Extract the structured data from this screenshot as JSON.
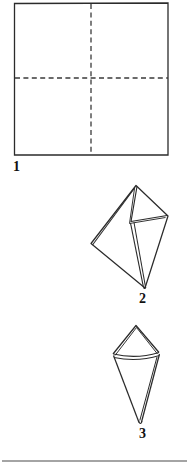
{
  "document": {
    "kind": "origami-instruction-diagram",
    "background_color": "#ffffff",
    "ink_color": "#1a1a1a",
    "steps_count": 3
  },
  "steps": [
    {
      "number": "1",
      "label": "1",
      "caption": "",
      "shape_name": "square-sheet-with-crease-lines",
      "description_hint": "square-outline-with-horizontal-and-vertical-dashed-creases"
    },
    {
      "number": "2",
      "label": "2",
      "caption": "",
      "shape_name": "folded-diamond-kite",
      "description_hint": "diamond-shaped-folded-paper-with-layered-flap"
    },
    {
      "number": "3",
      "label": "3",
      "caption": "",
      "shape_name": "folded-cone-kite",
      "description_hint": "narrow-kite-cone-shape-with-horizontal-fold-band"
    }
  ],
  "geometry": {
    "square": {
      "left": 14,
      "top": 3,
      "right": 168,
      "bottom": 155,
      "crease_vertical_x": 91,
      "crease_horizontal_y": 78,
      "dash_pattern": "5,3"
    },
    "figure2": {
      "apex_top": [
        136,
        185
      ],
      "vertex_right": [
        168,
        216
      ],
      "vertex_left": [
        91,
        243
      ],
      "vertex_fold": [
        131,
        222
      ],
      "vertex_bottom": [
        144,
        288
      ]
    },
    "figure3": {
      "apex_top": [
        136,
        325
      ],
      "vertex_left": [
        113,
        354
      ],
      "vertex_right": [
        159,
        352
      ],
      "vertex_bottom": [
        140,
        423
      ],
      "fold_band_y": 355
    },
    "footer_rule": {
      "y": 461,
      "x_start": 2,
      "x_end": 187
    }
  }
}
